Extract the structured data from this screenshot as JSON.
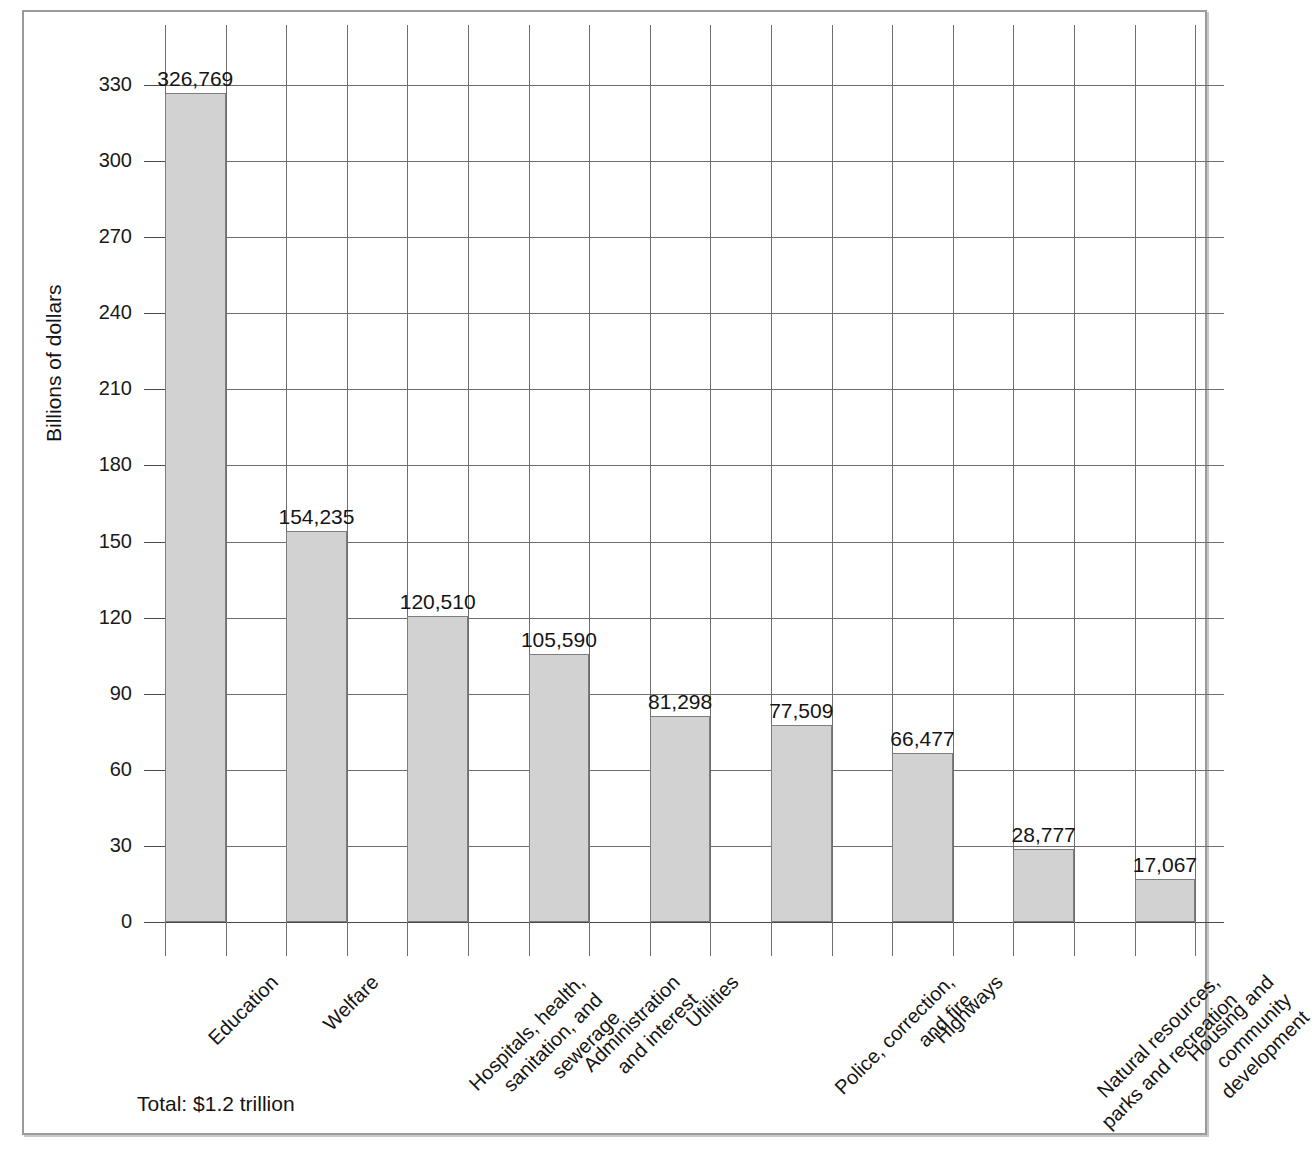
{
  "chart_data": {
    "type": "bar",
    "title": "",
    "xlabel": "",
    "ylabel": "Billions of dollars",
    "ylim": [
      0,
      330
    ],
    "grid": true,
    "legend": "none",
    "value_unit": "millions of dollars",
    "categories": [
      "Education",
      "Welfare",
      "Hospitals, health, sanitation, and sewerage",
      "Administration and interest",
      "Utilities",
      "Police, correction, and fire",
      "Highways",
      "Natural resources, parks and recreation",
      "Housing and community development"
    ],
    "category_lines": [
      [
        "Education"
      ],
      [
        "Welfare"
      ],
      [
        "Hospitals, health,",
        "sanitation, and",
        "sewerage"
      ],
      [
        "Administration",
        "and interest"
      ],
      [
        "Utilities"
      ],
      [
        "Police, correction,",
        "and fire"
      ],
      [
        "Highways"
      ],
      [
        "Natural resources,",
        "parks and recreation"
      ],
      [
        "Housing and",
        "community",
        "development"
      ]
    ],
    "values": [
      326769,
      154235,
      120510,
      105590,
      81298,
      77509,
      66477,
      28777,
      17067
    ],
    "value_labels": [
      "326,769",
      "154,235",
      "120,510",
      "105,590",
      "81,298",
      "77,509",
      "66,477",
      "28,777",
      "17,067"
    ],
    "values_billions": [
      326.769,
      154.235,
      120.51,
      105.59,
      81.298,
      77.509,
      66.477,
      28.777,
      17.067
    ],
    "y_ticks": [
      0,
      30,
      60,
      90,
      120,
      150,
      180,
      210,
      240,
      270,
      300,
      330
    ],
    "y_tick_labels": [
      "0",
      "30",
      "60",
      "90",
      "120",
      "150",
      "180",
      "210",
      "240",
      "270",
      "300",
      "330"
    ],
    "annotations": [
      "Total: $1.2 trillion"
    ],
    "colors": {
      "bar_fill": "#d2d2d2",
      "bar_stroke": "#7d7d7d",
      "grid": "#6e6e6e",
      "axis": "#4a4a4a",
      "text": "#141414",
      "frame": "#9a9a9a",
      "background": "#ffffff"
    }
  },
  "footer": {
    "total_label": "Total: $1.2 trillion"
  }
}
